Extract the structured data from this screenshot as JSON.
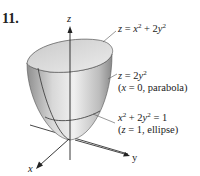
{
  "problem": {
    "number": "11."
  },
  "axes": {
    "z": "z",
    "y": "y",
    "x": "x"
  },
  "labels": {
    "surface": {
      "lhs": "z",
      "eq": " = ",
      "t1": "x",
      "p1": "2",
      "plus": " + 2",
      "t2": "y",
      "p2": "2"
    },
    "trace_x0": {
      "lhs": "z",
      "eq": " = 2",
      "t": "y",
      "p": "2",
      "note_open": "(",
      "note_var": "x",
      "note_rest": " = 0, parabola)"
    },
    "trace_z1": {
      "t1": "x",
      "p1": "2",
      "plus": " + 2",
      "t2": "y",
      "p2": "2",
      "rhs": " = 1",
      "note_open": "(",
      "note_var": "z",
      "note_rest": " = 1, ellipse)"
    }
  },
  "colors": {
    "surface_light": "#e6e6e6",
    "surface_dark": "#9a9a9a",
    "stroke": "#333333"
  }
}
